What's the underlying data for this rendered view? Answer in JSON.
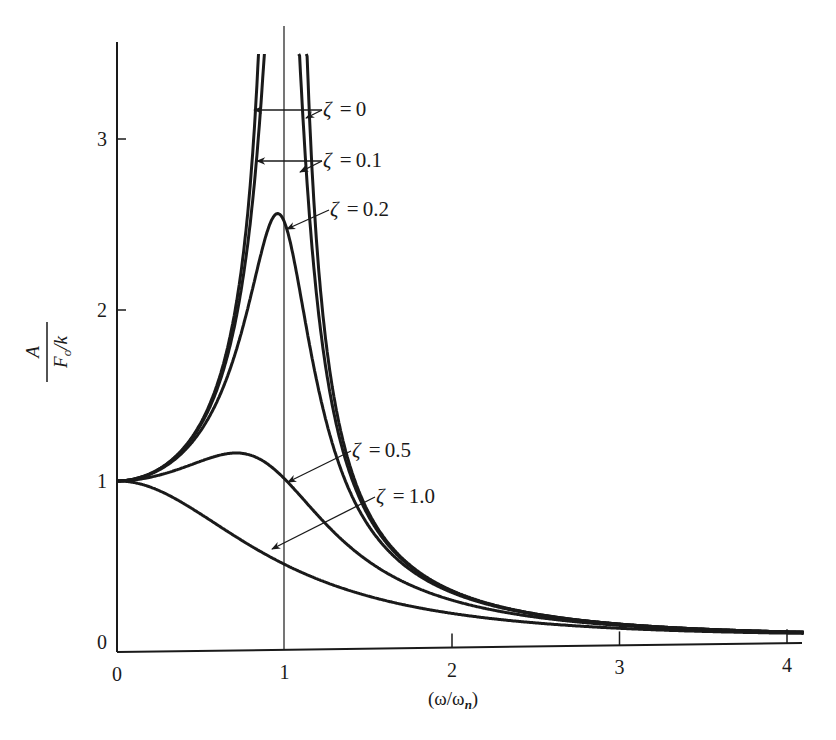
{
  "chart_data": {
    "type": "line",
    "title": "",
    "xlabel": "(ω/ωn)",
    "ylabel": "A / (Fo/k)",
    "xlim": [
      0,
      4.1
    ],
    "ylim": [
      0,
      3.5
    ],
    "x_ticks": [
      "0",
      "1",
      "2",
      "3",
      "4"
    ],
    "y_ticks": [
      "0",
      "1",
      "2",
      "3"
    ],
    "grid": false,
    "reference_line": {
      "x": 1,
      "description": "vertical line at resonance ω/ωn = 1"
    },
    "formula": "A/(Fo/k) = 1 / sqrt((1 - r^2)^2 + (2*zeta*r)^2), r = ω/ωn",
    "series": [
      {
        "name": "ζ = 0",
        "zeta": 0.0,
        "peak": "unbounded at r = 1",
        "x": [
          0,
          0.25,
          0.5,
          0.7,
          0.8,
          1.2,
          1.5,
          2.0,
          3.0,
          4.0
        ],
        "values": [
          1.0,
          1.07,
          1.33,
          1.96,
          2.78,
          2.27,
          0.8,
          0.33,
          0.125,
          0.067
        ]
      },
      {
        "name": "ζ = 0.1",
        "zeta": 0.1,
        "peak": "≈5.0 near r = 1",
        "x": [
          0,
          0.25,
          0.5,
          0.7,
          0.8,
          1.2,
          1.5,
          2.0,
          3.0,
          4.0
        ],
        "values": [
          1.0,
          1.06,
          1.32,
          1.89,
          2.62,
          2.05,
          0.78,
          0.33,
          0.125,
          0.066
        ]
      },
      {
        "name": "ζ = 0.2",
        "zeta": 0.2,
        "peak": "≈2.55 at r ≈ 0.96",
        "x": [
          0,
          0.25,
          0.5,
          0.7,
          0.8,
          0.96,
          1.2,
          1.5,
          2.0,
          3.0,
          4.0
        ],
        "values": [
          1.0,
          1.06,
          1.29,
          1.73,
          2.1,
          2.55,
          1.61,
          0.71,
          0.32,
          0.124,
          0.066
        ]
      },
      {
        "name": "ζ = 0.5",
        "zeta": 0.5,
        "peak": "≈1.15 at r ≈ 0.71",
        "x": [
          0,
          0.25,
          0.5,
          0.71,
          1.0,
          1.5,
          2.0,
          3.0,
          4.0
        ],
        "values": [
          1.0,
          1.03,
          1.11,
          1.15,
          1.0,
          0.55,
          0.28,
          0.12,
          0.064
        ]
      },
      {
        "name": "ζ = 1.0",
        "zeta": 1.0,
        "peak": "1.0 at r = 0",
        "x": [
          0,
          0.25,
          0.5,
          1.0,
          1.5,
          2.0,
          3.0,
          4.0
        ],
        "values": [
          1.0,
          0.94,
          0.8,
          0.5,
          0.31,
          0.2,
          0.1,
          0.059
        ]
      }
    ],
    "annotations": [
      {
        "text": "ζ = 0",
        "points_to": [
          "left branch near r≈0.8, y≈3.2",
          "right branch near r≈1.15, y≈3.2"
        ]
      },
      {
        "text": "ζ = 0.1",
        "points_to": [
          "left branch near r≈0.82, y≈2.9",
          "right branch near r≈1.13, y≈2.85"
        ]
      },
      {
        "text": "ζ = 0.2",
        "points_to": [
          "curve right of peak near r≈1.0, y≈2.5"
        ]
      },
      {
        "text": "ζ = 0.5",
        "points_to": [
          "curve near r≈1.05, y≈0.98"
        ]
      },
      {
        "text": "ζ = 1.0",
        "points_to": [
          "curve near r≈0.93, y≈0.55"
        ]
      }
    ]
  },
  "axes": {
    "x_label_main": "(ω/ω",
    "x_label_sub": "n",
    "x_label_close": ")",
    "y_label_num": "A",
    "y_label_den_F": "F",
    "y_label_den_sub": "o",
    "y_label_den_rest": "/k"
  },
  "colors": {
    "ink": "#1a1a1a",
    "background": "#ffffff"
  }
}
